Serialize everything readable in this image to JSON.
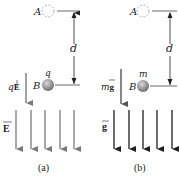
{
  "panels": [
    {
      "id": "a",
      "caption": "(a)",
      "point_a_label": "A",
      "point_b_label": "B",
      "particle_label": "q",
      "distance_label": "d",
      "force_label_prefix": "q",
      "force_label_vector": "E",
      "field_label": "E",
      "field_color": "#7a7a7a",
      "force_color": "#7a7a7a",
      "field_arrow_count": 5
    },
    {
      "id": "b",
      "caption": "(b)",
      "point_a_label": "A",
      "point_b_label": "B",
      "particle_label": "m",
      "distance_label": "d",
      "force_label_prefix": "m",
      "force_label_vector": "g",
      "field_label": "g",
      "field_color": "#1e1e1e",
      "force_color": "#555555",
      "field_arrow_count": 5
    }
  ]
}
